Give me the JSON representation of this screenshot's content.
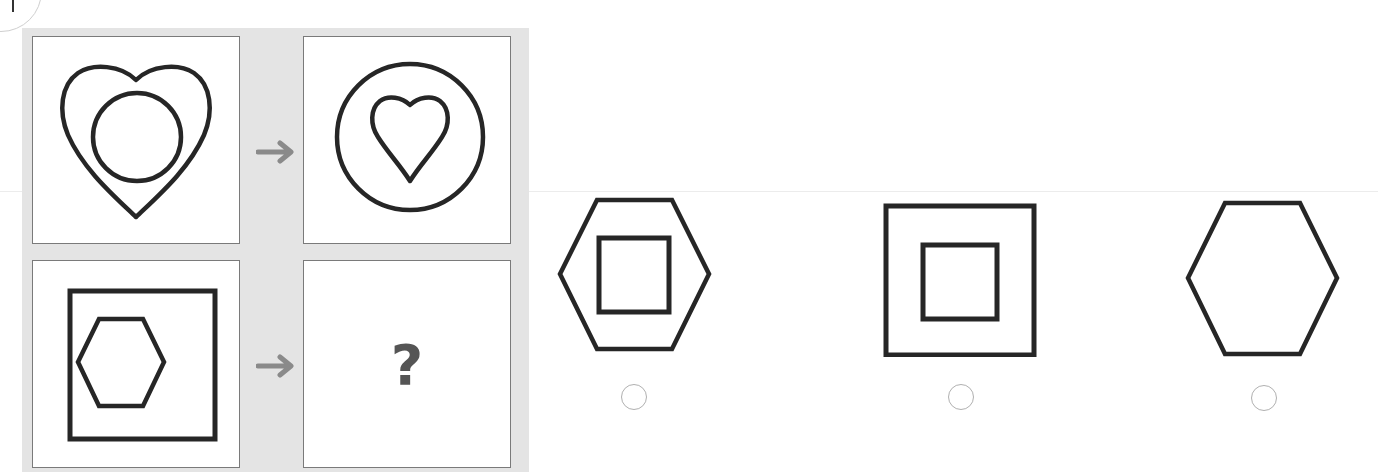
{
  "puzzle": {
    "type": "analogy",
    "question_mark": "?",
    "example_pair": {
      "from": "heart containing circle",
      "to": "circle containing heart"
    },
    "test_pair": {
      "from": "square containing hexagon",
      "to": "?"
    }
  },
  "options": [
    {
      "label": "hexagon containing square",
      "selected": false
    },
    {
      "label": "square containing square",
      "selected": false
    },
    {
      "label": "hexagon only",
      "selected": false
    }
  ],
  "colors": {
    "panel_bg": "#e4e4e4",
    "stroke": "#262626",
    "arrow": "#8a8a8a",
    "radio_border": "#b0b0b0"
  }
}
